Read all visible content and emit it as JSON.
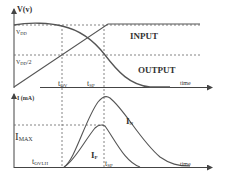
{
  "diagram": {
    "type": "timing-waveform",
    "colors": {
      "line": "#555555",
      "dashed": "#666666",
      "text": "#333333",
      "background": "#ffffff"
    },
    "voltage_plot": {
      "y_axis_label": "V(v)",
      "x_axis_label": "time",
      "levels": [
        {
          "name": "V",
          "sub": "DD",
          "display": "Vdd"
        },
        {
          "name": "V",
          "sub": "DD",
          "suffix": "/2",
          "display": "Vdd/2"
        }
      ],
      "time_markers": [
        {
          "name": "t",
          "sub": "OV"
        },
        {
          "name": "t",
          "sub": "SP"
        }
      ],
      "curves": [
        {
          "label": "INPUT",
          "shape": "linear rise 0 → Vdd, then flat"
        },
        {
          "label": "OUTPUT",
          "shape": "flat at Vdd, then falls to 0"
        }
      ]
    },
    "current_plot": {
      "y_axis_label": "I (mA)",
      "x_axis_label": "time",
      "levels": [
        {
          "name": "I",
          "sub": "MAX"
        }
      ],
      "time_markers": [
        {
          "name": "t",
          "sub": "OVLH"
        },
        {
          "name": "t",
          "sub": "SP"
        }
      ],
      "curves": [
        {
          "name": "I",
          "sub": "N",
          "shape": "bell, larger peak at t_SP"
        },
        {
          "name": "I",
          "sub": "P",
          "shape": "bell, peak I_MAX at t_SP"
        }
      ]
    }
  }
}
